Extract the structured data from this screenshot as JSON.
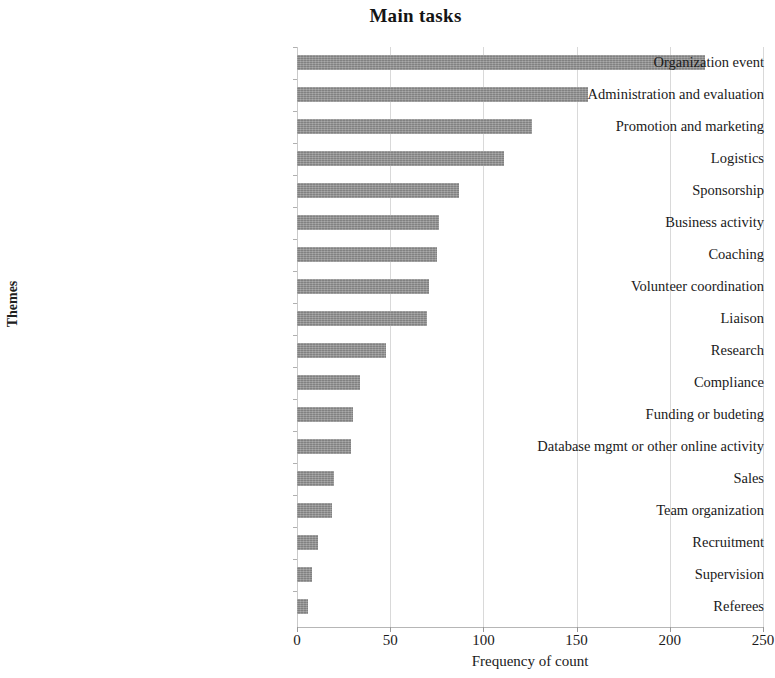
{
  "chart_data": {
    "type": "bar",
    "orientation": "horizontal",
    "title": "Main tasks",
    "xlabel": "Frequency of count",
    "ylabel": "Themes",
    "xlim": [
      0,
      250
    ],
    "xticks": [
      0,
      50,
      100,
      150,
      200,
      250
    ],
    "grid": "vertical",
    "legend": null,
    "bar_color": "#8e8e8e",
    "categories": [
      "Organization event",
      "Administration and evaluation",
      "Promotion and marketing",
      "Logistics",
      "Sponsorship",
      "Business activity",
      "Coaching",
      "Volunteer coordination",
      "Liaison",
      "Research",
      "Compliance",
      "Funding or budeting",
      "Database mgmt or other online activity",
      "Sales",
      "Team organization",
      "Recruitment",
      "Supervision",
      "Referees"
    ],
    "values": [
      219,
      156,
      126,
      111,
      87,
      76,
      75,
      71,
      70,
      48,
      34,
      30,
      29,
      20,
      19,
      11,
      8,
      6
    ]
  }
}
